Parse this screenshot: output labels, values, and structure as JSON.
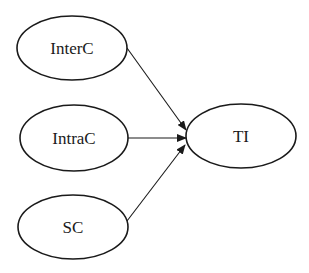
{
  "diagram": {
    "type": "path-model",
    "colors": {
      "stroke": "#1a1a1a",
      "fill": "#ffffff",
      "text": "#1a1a1a",
      "background": "#ffffff"
    },
    "nodes": [
      {
        "id": "InterC",
        "label": "InterC",
        "cx": 72,
        "cy": 48,
        "rx": 55,
        "ry": 32
      },
      {
        "id": "IntraC",
        "label": "IntraC",
        "cx": 74,
        "cy": 138,
        "rx": 54,
        "ry": 33
      },
      {
        "id": "SC",
        "label": "SC",
        "cx": 73,
        "cy": 227,
        "rx": 55,
        "ry": 32
      },
      {
        "id": "TI",
        "label": "TI",
        "cx": 241,
        "cy": 136,
        "rx": 55,
        "ry": 32
      }
    ],
    "edges": [
      {
        "from": "InterC",
        "to": "TI",
        "x1": 127,
        "y1": 48,
        "x2": 186,
        "y2": 130
      },
      {
        "from": "IntraC",
        "to": "TI",
        "x1": 128,
        "y1": 138,
        "x2": 186,
        "y2": 138
      },
      {
        "from": "SC",
        "to": "TI",
        "x1": 127,
        "y1": 221,
        "x2": 185,
        "y2": 145
      }
    ]
  }
}
